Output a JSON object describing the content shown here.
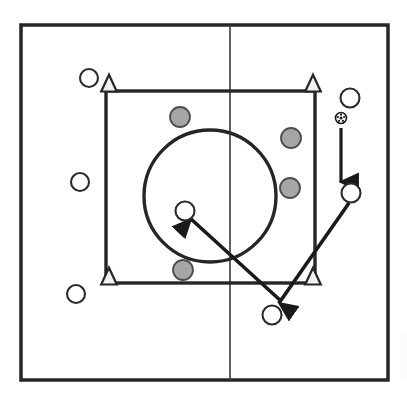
{
  "diagram": {
    "type": "sports-play-diagram",
    "sport": "soccer",
    "colors": {
      "line": "#262626",
      "field_fill": "#ffffff",
      "attacker_fill": "#ffffff",
      "defender_fill": "#a6a6a6",
      "cone_fill": "#f2f2f2",
      "arrow": "#1a1a1a",
      "background": "#ffffff"
    },
    "field": {
      "name": "outer-field-boundary",
      "x": 21,
      "y": 25,
      "width": 367,
      "height": 355,
      "stroke_width": 3.5
    },
    "halfway_line": {
      "name": "halfway-line",
      "x": 230,
      "y1": 25,
      "y2": 380,
      "stroke_width": 1.6
    },
    "grid_square": {
      "name": "inner-grid-square",
      "x": 106,
      "y": 91,
      "width": 209,
      "height": 192,
      "stroke_width": 3.4
    },
    "center_circle": {
      "name": "center-circle",
      "cx": 210,
      "cy": 196,
      "r": 66,
      "stroke_width": 3.4
    },
    "cones": [
      {
        "label": "cone-top-left",
        "cx": 109,
        "cy": 84,
        "size": 15
      },
      {
        "label": "cone-top-right",
        "cx": 313,
        "cy": 84,
        "size": 15
      },
      {
        "label": "cone-bottom-left",
        "cx": 109,
        "cy": 277,
        "size": 15
      },
      {
        "label": "cone-bottom-right",
        "cx": 313,
        "cy": 277,
        "size": 15
      }
    ],
    "attackers": [
      {
        "label": "attacker-left-top",
        "cx": 89,
        "cy": 78,
        "r": 9
      },
      {
        "label": "attacker-left-middle",
        "cx": 80,
        "cy": 182,
        "r": 9
      },
      {
        "label": "attacker-left-bottom",
        "cx": 76,
        "cy": 294,
        "r": 9
      },
      {
        "label": "attacker-right-top",
        "cx": 350,
        "cy": 98,
        "r": 9.5
      },
      {
        "label": "attacker-right-receiver",
        "cx": 351,
        "cy": 193,
        "r": 9.5
      },
      {
        "label": "attacker-center-target",
        "cx": 185,
        "cy": 211,
        "r": 9.5
      },
      {
        "label": "attacker-bottom-passer",
        "cx": 272,
        "cy": 315,
        "r": 9.5
      }
    ],
    "defenders": [
      {
        "label": "defender-top-center",
        "cx": 180,
        "cy": 117,
        "r": 10
      },
      {
        "label": "defender-right-upper",
        "cx": 291,
        "cy": 138,
        "r": 10
      },
      {
        "label": "defender-right-lower",
        "cx": 290,
        "cy": 188,
        "r": 10
      },
      {
        "label": "defender-bottom-center",
        "cx": 183,
        "cy": 270,
        "r": 10
      }
    ],
    "ball": {
      "label": "soccer-ball",
      "cx": 341,
      "cy": 118,
      "r": 5.5
    },
    "arrows": [
      {
        "label": "arrow-ball-drop-down",
        "kind": "pass",
        "x1": 341,
        "y1": 128,
        "x2": 341,
        "y2": 182,
        "stroke_width": 3.2
      },
      {
        "label": "arrow-receiver-to-bottom-passer",
        "kind": "run",
        "x1": 349,
        "y1": 203,
        "x2": 279,
        "y2": 303,
        "stroke_width": 3.6
      },
      {
        "label": "arrow-bottom-passer-to-center-target",
        "kind": "pass",
        "x1": 281,
        "y1": 301,
        "x2": 191,
        "y2": 219,
        "stroke_width": 3.6
      }
    ]
  }
}
